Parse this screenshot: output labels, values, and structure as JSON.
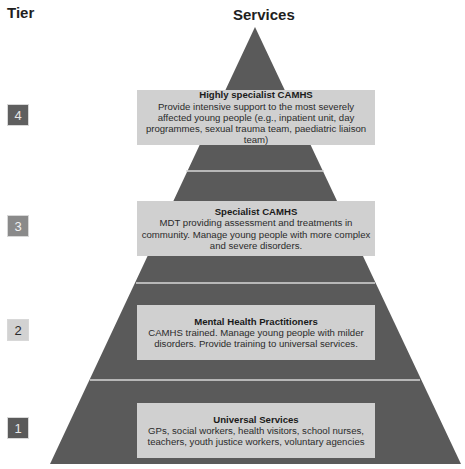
{
  "headers": {
    "tier": "Tier",
    "services": "Services"
  },
  "colors": {
    "pyramid": "#5a5a5a",
    "divider": "#d7d7d7",
    "box": "#d0d0d0",
    "tier4_badge": "#5f5f5f",
    "tier3_badge": "#8a8a8a",
    "tier2_badge": "#d2d2d2",
    "tier1_badge": "#5a5a5a"
  },
  "tiers": [
    {
      "number": "4",
      "title": "Highly specialist CAMHS",
      "description": "Provide intensive support to the most severely affected young people (e.g., inpatient unit, day programmes, sexual trauma team, paediatric liaison team)"
    },
    {
      "number": "3",
      "title": "Specialist CAMHS",
      "description": "MDT providing assessment and treatments in community. Manage young people with more complex and severe disorders."
    },
    {
      "number": "2",
      "title": "Mental Health Practitioners",
      "description": "CAMHS trained. Manage young people with milder disorders. Provide training to universal services."
    },
    {
      "number": "1",
      "title": "Universal Services",
      "description": "GPs, social workers, health visitors, school nurses, teachers, youth justice workers, voluntary agencies"
    }
  ]
}
